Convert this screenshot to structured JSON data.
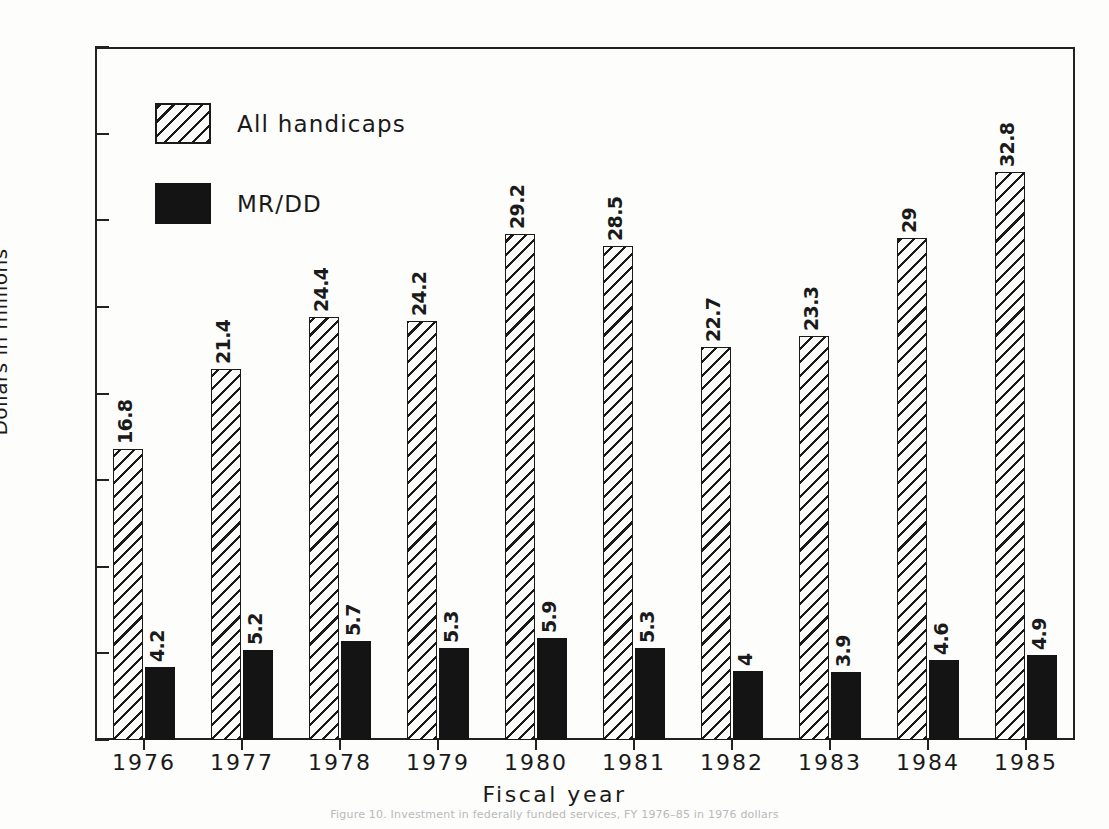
{
  "chart_data": {
    "type": "bar",
    "title": "",
    "xlabel": "Fiscal year",
    "ylabel": "Dollars in millions",
    "categories": [
      "1976",
      "1977",
      "1978",
      "1979",
      "1980",
      "1981",
      "1982",
      "1983",
      "1984",
      "1985"
    ],
    "series": [
      {
        "name": "All handicaps",
        "fill": "hatched",
        "values": [
          16.8,
          21.4,
          24.4,
          24.2,
          29.2,
          28.5,
          22.7,
          23.3,
          29,
          32.8
        ],
        "labels": [
          "16.8",
          "21.4",
          "24.4",
          "24.2",
          "29.2",
          "28.5",
          "22.7",
          "23.3",
          "29",
          "32.8"
        ]
      },
      {
        "name": "MR/DD",
        "fill": "solid",
        "values": [
          4.2,
          5.2,
          5.7,
          5.3,
          5.9,
          5.3,
          4,
          3.9,
          4.6,
          4.9
        ],
        "labels": [
          "4.2",
          "5.2",
          "5.7",
          "5.3",
          "5.9",
          "5.3",
          "4",
          "3.9",
          "4.6",
          "4.9"
        ]
      }
    ],
    "ylim": [
      0,
      40
    ],
    "yticks": [
      0,
      5,
      10,
      15,
      20,
      25,
      30,
      35,
      40
    ],
    "ytick_labels": [
      "0",
      "5",
      "10",
      "15",
      "20",
      "25",
      "30",
      "35",
      "40"
    ],
    "grid": false,
    "legend_position": "top-left",
    "value_labels_rotated": true,
    "colors": {
      "axis": "#1a1a1a",
      "series_all_handicaps": "#fbfbfa",
      "series_mr_dd": "#141414",
      "background": "#fdfdfc"
    }
  },
  "legend": {
    "items": [
      {
        "label": "All handicaps",
        "fill": "hatched"
      },
      {
        "label": "MR/DD",
        "fill": "solid"
      }
    ]
  },
  "axes": {
    "y_title": "Dollars in millions",
    "x_title": "Fiscal year"
  },
  "caption": {
    "text": "Figure 10. Investment in federally funded services, FY 1976–85 in 1976 dollars"
  }
}
